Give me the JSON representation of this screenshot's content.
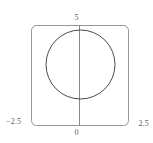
{
  "figure": {
    "title": "",
    "background_color": "#ffffff",
    "frame_color": "#8a8a8a",
    "curve_color": "#4a4a4a",
    "axis_color": "#7a7a7a",
    "label_color": "#5d5d5d"
  },
  "labels": {
    "y_max": "5",
    "x_zero": "0",
    "x_min": "−2.5",
    "x_max": "2.5"
  },
  "chart_data": {
    "type": "line",
    "title": "",
    "xlabel": "",
    "ylabel": "",
    "xlim": [
      -2.5,
      2.5
    ],
    "ylim": [
      0,
      5
    ],
    "grid": false,
    "legend": null,
    "frame": {
      "visible": true,
      "rounded_corners": true,
      "left_px": 31,
      "top_px": 25,
      "right_px": 128,
      "bottom_px": 125
    },
    "tick_labels": {
      "x": [
        "−2.5",
        "0",
        "2.5"
      ],
      "y": [
        "5"
      ]
    },
    "axis_lines": [
      {
        "name": "vertical-axis-x0",
        "orientation": "vertical",
        "at_x": 0,
        "from_y": 0,
        "to_y": 5
      }
    ],
    "series": [
      {
        "name": "circle-curve",
        "shape": "circle",
        "center": [
          0,
          2.5
        ],
        "radius_x": 1.78,
        "radius_y": 1.78,
        "closed": true,
        "fill": "none",
        "stroke": "#4a4a4a",
        "stroke_width_px": 1,
        "pixel_geometry": {
          "center_x_px": 80.5,
          "center_y_px": 64.5,
          "radius_px": 34.5
        }
      }
    ],
    "annotations": []
  }
}
